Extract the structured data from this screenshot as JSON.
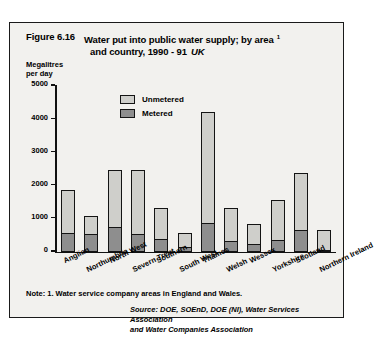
{
  "figure": {
    "number": "Figure 6.16",
    "title": "Water put into public water supply; by area",
    "title_line2": "and country, 1990 - 91",
    "region": "UK",
    "footnote_ref": "1"
  },
  "axis": {
    "y_title_line1": "Megalitres",
    "y_title_line2": "per day"
  },
  "legend": {
    "unmetered_label": "Unmetered",
    "metered_label": "Metered",
    "unmetered_color": "#cfcfcb",
    "metered_color": "#8e8e8e"
  },
  "notes": {
    "note": "Note: 1. Water service company areas in England and Wales.",
    "source_line1": "Source: DOE, SOEnD, DOE (NI), Water Services Association",
    "source_line2": "and Water Companies Association"
  },
  "chart_data": {
    "type": "bar",
    "stacked": true,
    "xlabel": "",
    "ylabel": "Megalitres per day",
    "ylim": [
      0,
      5000
    ],
    "yticks": [
      0,
      1000,
      2000,
      3000,
      4000,
      5000
    ],
    "ytick_labels": [
      "0",
      "1000",
      "2000",
      "3000",
      "4000",
      "5000"
    ],
    "grid": false,
    "legend_position": "upper-center",
    "categories": [
      "Anglian",
      "Northumbria",
      "North West",
      "Severn Trent",
      "Southern",
      "South West",
      "Thames",
      "Welsh",
      "Wessex",
      "Yorkshire",
      "Scotland",
      "Northern Ireland"
    ],
    "series": [
      {
        "name": "Metered",
        "color": "#8e8e8e",
        "values": [
          570,
          520,
          730,
          520,
          380,
          150,
          870,
          330,
          230,
          340,
          640,
          60
        ]
      },
      {
        "name": "Unmetered",
        "color": "#cfcfcb",
        "values": [
          1280,
          560,
          1720,
          1930,
          920,
          400,
          3330,
          990,
          610,
          1210,
          1740,
          590
        ]
      }
    ],
    "totals": [
      1850,
      1080,
      2450,
      2450,
      1300,
      550,
      4200,
      1320,
      840,
      1550,
      2380,
      650
    ]
  }
}
